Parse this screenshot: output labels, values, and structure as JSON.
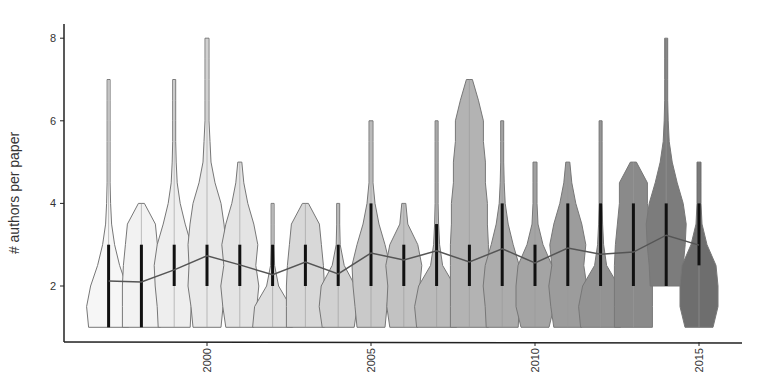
{
  "chart_data": {
    "type": "violin",
    "title": "",
    "xlabel": "",
    "ylabel": "# authors per paper",
    "ylim": [
      0.6,
      8.4
    ],
    "yticks": [
      2,
      4,
      6,
      8
    ],
    "xticks": [
      2000,
      2005,
      2010,
      2015
    ],
    "categories": [
      1997,
      1998,
      1999,
      2000,
      2001,
      2002,
      2003,
      2004,
      2005,
      2006,
      2007,
      2008,
      2009,
      2010,
      2011,
      2012,
      2013,
      2014,
      2015
    ],
    "series": [
      {
        "name": "mean",
        "type": "line",
        "values": [
          2.12,
          2.1,
          2.39,
          2.73,
          2.51,
          2.27,
          2.58,
          2.29,
          2.8,
          2.63,
          2.85,
          2.58,
          2.9,
          2.56,
          2.92,
          2.77,
          2.82,
          3.23,
          2.99
        ]
      },
      {
        "name": "min",
        "values": [
          1,
          1,
          1,
          1,
          1,
          1,
          1,
          1,
          1,
          1,
          1,
          1,
          1,
          1,
          1,
          1,
          1,
          2,
          1
        ]
      },
      {
        "name": "max",
        "values": [
          7,
          4,
          7,
          8,
          5,
          4,
          4,
          4,
          6,
          4,
          6,
          7,
          6,
          5,
          5,
          6,
          5,
          8,
          5
        ]
      },
      {
        "name": "q1",
        "values": [
          1,
          1,
          2,
          2,
          2,
          2,
          2,
          2,
          2,
          2,
          2,
          2,
          2,
          2,
          2,
          2,
          2,
          2,
          2.5
        ]
      },
      {
        "name": "q3",
        "values": [
          3,
          3,
          3,
          3,
          3,
          3,
          3,
          3,
          4,
          3,
          3.5,
          3,
          4,
          3,
          4,
          4,
          4,
          4,
          4
        ]
      }
    ],
    "fill_colors": [
      "#f6f6f6",
      "#f2f2f2",
      "#eeeeee",
      "#e9e9e9",
      "#e4e4e4",
      "#dedede",
      "#d8d8d8",
      "#d1d1d1",
      "#c9c9c9",
      "#c2c2c2",
      "#bababa",
      "#b3b3b3",
      "#acacac",
      "#a4a4a4",
      "#9c9c9c",
      "#939393",
      "#8a8a8a",
      "#7c7c7c",
      "#6e6e6e"
    ],
    "profiles": [
      [
        20,
        22,
        18,
        11,
        6,
        3,
        2,
        1.5,
        1.5,
        1.5,
        1.5,
        1.5,
        1.5
      ],
      [
        19,
        19,
        19,
        18,
        16,
        14,
        9
      ],
      [
        16,
        17,
        19,
        20,
        17,
        11,
        6,
        3,
        2,
        1.5,
        1.5,
        1.5,
        1.5
      ],
      [
        14,
        16,
        19,
        18,
        19,
        17,
        14,
        8,
        4,
        3,
        2,
        2,
        2,
        2,
        2
      ],
      [
        14,
        17,
        19,
        16,
        18,
        14,
        8,
        4,
        2
      ]
    ]
  },
  "axes": {
    "y_tick_labels": [
      "2",
      "4",
      "6",
      "8"
    ],
    "x_tick_labels": [
      "2000",
      "2005",
      "2010",
      "2015"
    ]
  }
}
